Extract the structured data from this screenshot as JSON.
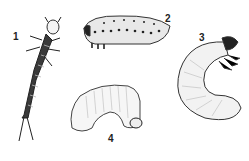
{
  "figure": {
    "specimens": [
      {
        "label": "1",
        "kind": "elongated segmented larva (campodeiform)"
      },
      {
        "label": "2",
        "kind": "spotted sawfly-like larva (eruciform)"
      },
      {
        "label": "3",
        "kind": "C-shaped grub with legs (scarabaeiform)"
      },
      {
        "label": "4",
        "kind": "legless curved grub (vermiform)"
      }
    ]
  },
  "colors": {
    "ink": "#222222",
    "shade": "#555555",
    "paper": "#ffffff"
  }
}
